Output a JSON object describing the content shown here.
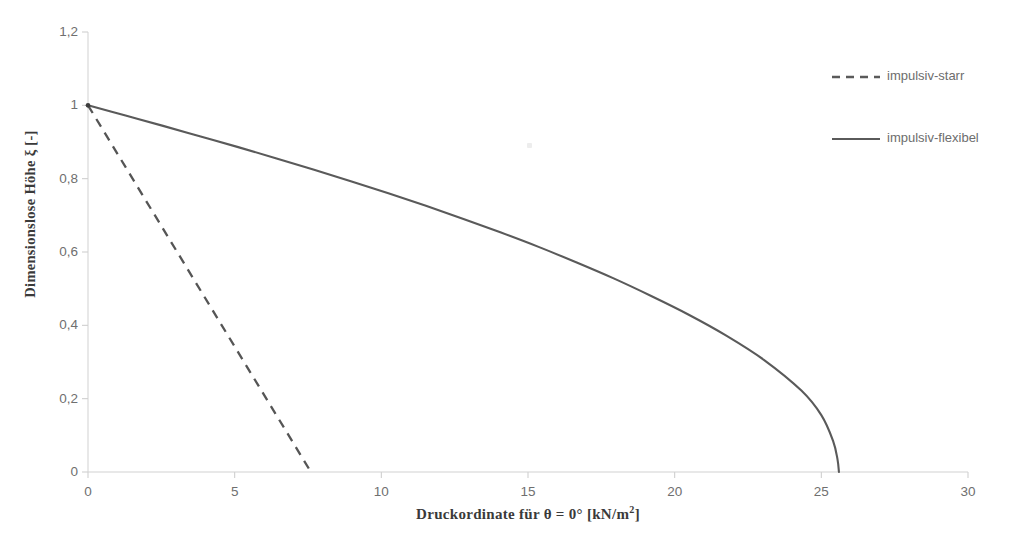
{
  "chart_data": {
    "type": "line",
    "title": "",
    "xlabel": "Druckordinate für θ = 0° [kN/m²]",
    "xlabel_parts": {
      "main": "Druckordinate  für  θ = 0°  [kN/m",
      "sup": "2",
      "tail": "]"
    },
    "ylabel": "Dimensionslose  Höhe  ξ [-]",
    "xlim": [
      0,
      30
    ],
    "ylim": [
      0,
      1.2
    ],
    "grid": false,
    "legend_position": "right",
    "xticks": [
      "0",
      "5",
      "10",
      "15",
      "20",
      "25",
      "30"
    ],
    "xtick_values": [
      0,
      5,
      10,
      15,
      20,
      25,
      30
    ],
    "yticks": [
      "0",
      "0,2",
      "0,4",
      "0,6",
      "0,8",
      "1",
      "1,2"
    ],
    "ytick_values": [
      0,
      0.2,
      0.4,
      0.6,
      0.8,
      1.0,
      1.2
    ],
    "series": [
      {
        "name": "impulsiv-starr",
        "style": "dashed",
        "color": "#555555",
        "x": [
          0.0,
          7.6
        ],
        "y": [
          1.0,
          0.0
        ]
      },
      {
        "name": "impulsiv-flexibel",
        "style": "solid",
        "color": "#5a5a5a",
        "x": [
          0.0,
          1.28,
          2.56,
          3.84,
          5.12,
          6.4,
          7.68,
          8.96,
          10.24,
          11.52,
          12.8,
          14.08,
          15.36,
          16.64,
          17.92,
          19.2,
          20.48,
          21.76,
          23.04,
          24.32,
          25.0,
          25.4,
          25.55,
          25.6
        ],
        "y": [
          1.0,
          0.972,
          0.944,
          0.915,
          0.886,
          0.856,
          0.825,
          0.793,
          0.76,
          0.726,
          0.69,
          0.653,
          0.614,
          0.572,
          0.528,
          0.48,
          0.429,
          0.372,
          0.306,
          0.222,
          0.155,
          0.085,
          0.035,
          0.0
        ]
      }
    ],
    "annotations": []
  },
  "legend": {
    "items": [
      {
        "label": "impulsiv-starr",
        "style": "dashed"
      },
      {
        "label": "impulsiv-flexibel",
        "style": "solid"
      }
    ]
  },
  "caption": {
    "text": ""
  },
  "colors": {
    "line": "#5a5a5a",
    "axis": "#d5d5d5",
    "tick_text": "#6f6f6f",
    "title_text": "#3a3a3a",
    "legend_text": "#6d6d6d",
    "background": "#ffffff"
  }
}
